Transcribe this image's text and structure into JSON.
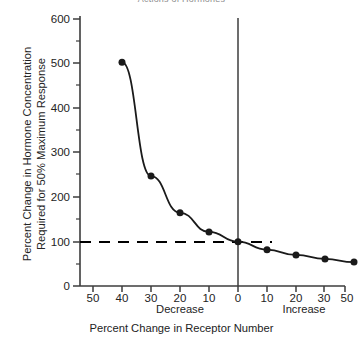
{
  "figure": {
    "clipped_title": "Actions of Hormones",
    "xlabel": "Percent Change in Receptor Number",
    "ylabel": "Percent Change in Hormone Concentration\nRequired for 50% Maximum Response",
    "direction_left": "Decrease",
    "direction_right": "Increase",
    "colors": {
      "line": "#1a1a1a",
      "marker": "#1a1a1a",
      "axis": "#3c3c3c",
      "reference_line": "#000000",
      "background": "#ffffff"
    }
  },
  "chart_data": {
    "type": "line",
    "title": "Actions of Hormones",
    "xlabel": "Percent Change in Receptor Number",
    "ylabel": "Percent Change in Hormone Concentration Required for 50% Maximum Response",
    "x": [
      -40,
      -30,
      -20,
      -10,
      0,
      10,
      20,
      30,
      40
    ],
    "values": [
      505,
      248,
      165,
      122,
      100,
      82,
      70,
      61,
      54
    ],
    "xlim": [
      -55,
      55
    ],
    "ylim": [
      0,
      600
    ],
    "xticks": [
      -50,
      -40,
      -30,
      -20,
      -10,
      0,
      10,
      20,
      30,
      40,
      50
    ],
    "xticklabels": [
      "50",
      "40",
      "30",
      "20",
      "10",
      "0",
      "10",
      "20",
      "30",
      "40",
      "50"
    ],
    "yticks": [
      0,
      100,
      200,
      300,
      400,
      500,
      600
    ],
    "yticklabels": [
      "0",
      "100",
      "200",
      "300",
      "400",
      "500",
      "600"
    ],
    "y_minor_ticks": [
      50,
      150,
      250,
      350,
      450,
      550
    ],
    "grid": false,
    "legend": null,
    "annotations": [
      {
        "type": "hline",
        "y": 100,
        "style": "dashed",
        "label": "100% reference"
      },
      {
        "type": "vline",
        "x": 0,
        "style": "solid",
        "label": "no change in receptor number"
      },
      {
        "type": "axis-region",
        "x": -50,
        "label": "Decrease"
      },
      {
        "type": "axis-region",
        "x": 30,
        "label": "Increase"
      }
    ],
    "marker": "filled-circle",
    "marker_size": 7
  }
}
